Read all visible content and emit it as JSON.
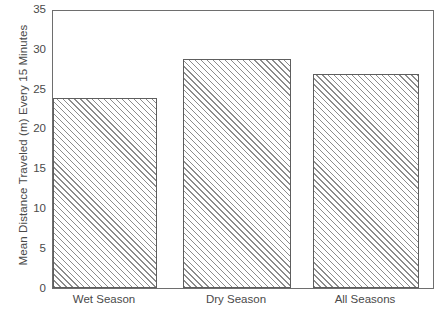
{
  "chart_data": {
    "type": "bar",
    "title": "",
    "xlabel": "",
    "ylabel": "Mean Distance Traveled (m) Every 15 Minutes",
    "categories": [
      "Wet Season",
      "Dry Season",
      "All Seasons"
    ],
    "values": [
      24,
      29,
      27
    ],
    "ylim": [
      0,
      35
    ],
    "yticks": [
      0,
      5,
      10,
      15,
      20,
      25,
      30,
      35
    ],
    "ytick_labels": [
      "0",
      "5",
      "10",
      "15",
      "20",
      "25",
      "30",
      "35"
    ],
    "grid": false,
    "legend": null,
    "series": [
      {
        "name": "Mean Distance Traveled",
        "values": [
          24,
          29,
          27
        ]
      }
    ],
    "style": {
      "bar_fill": "#ffffff",
      "bar_hatch": "diagonal-forward",
      "bar_hatch_color": "#8c8c8c",
      "bar_edge_color": "#5e5e5e",
      "frame_color": "#6e6e6e",
      "text_color": "#4a4a4a",
      "background": "#ffffff"
    }
  }
}
